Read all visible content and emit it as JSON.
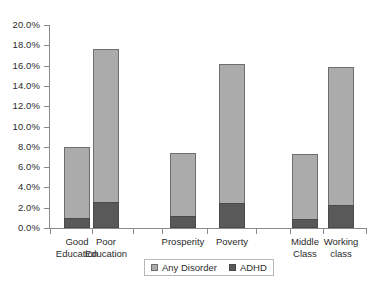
{
  "chart_data": {
    "type": "bar",
    "stacked": true,
    "title": "",
    "subtitle": "",
    "xlabel": "",
    "ylabel": "",
    "ylim": [
      0,
      20
    ],
    "ytick_labels": [
      "0.0%",
      "2.0%",
      "4.0%",
      "6.0%",
      "8.0%",
      "10.0%",
      "12.0%",
      "14.0%",
      "16.0%",
      "18.0%",
      "20.0%"
    ],
    "ytick_values": [
      0,
      2,
      4,
      6,
      8,
      10,
      12,
      14,
      16,
      18,
      20
    ],
    "grid": false,
    "legend_position": "bottom",
    "categories": [
      "Good Education",
      "Poor Education",
      "Prosperity",
      "Poverty",
      "Middle Class",
      "Working class"
    ],
    "category_lines": [
      [
        "Good",
        "Education"
      ],
      [
        "Poor",
        "Education"
      ],
      [
        "Prosperity"
      ],
      [
        "Poverty"
      ],
      [
        "Middle",
        "Class"
      ],
      [
        "Working",
        "class"
      ]
    ],
    "series": [
      {
        "name": "Any Disorder",
        "color": "#ababab",
        "values": [
          8.0,
          17.6,
          7.4,
          16.2,
          7.3,
          15.9
        ]
      },
      {
        "name": "ADHD",
        "color": "#595959",
        "values": [
          1.0,
          2.6,
          1.2,
          2.5,
          0.9,
          2.3
        ]
      }
    ]
  },
  "legend": {
    "entries": [
      {
        "label": "Any Disorder",
        "swatch": "legend-swatch-any-disorder"
      },
      {
        "label": "ADHD",
        "swatch": "legend-swatch-adhd"
      }
    ]
  },
  "axis": {
    "y_label_0": "0.0%",
    "y_label_1": "2.0%",
    "y_label_2": "4.0%",
    "y_label_3": "6.0%",
    "y_label_4": "8.0%",
    "y_label_5": "10.0%",
    "y_label_6": "12.0%",
    "y_label_7": "14.0%",
    "y_label_8": "16.0%",
    "y_label_9": "18.0%",
    "y_label_10": "20.0%"
  },
  "categories_text": {
    "c0": "Good\nEducation",
    "c1": "Poor\nEducation",
    "c2": "Prosperity",
    "c3": "Poverty",
    "c4": "Middle\nClass",
    "c5": "Working\nclass"
  }
}
